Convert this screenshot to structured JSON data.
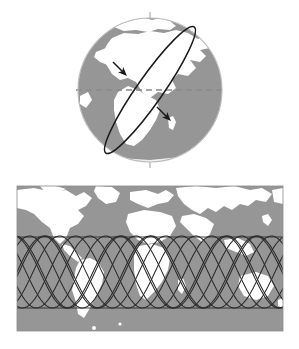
{
  "figure": {
    "caption": "",
    "width": 299,
    "height": 349,
    "background_color": "#ffffff"
  },
  "colors": {
    "ocean_gray": "#969696",
    "land_white": "#ffffff",
    "globe_outline": "#b4b4b4",
    "polar_axis": "#c0c0c0",
    "equator_dash": "#909090",
    "orbit_line": "#1a1a1a",
    "ground_track": "#2a2a2a",
    "map_border": "#8c8c8c"
  },
  "globe_panel": {
    "name": "globe-with-orbit",
    "center_x": 150,
    "center_y": 90,
    "radius": 72,
    "polar_axis": {
      "label": "polar-axis",
      "top_y": 12,
      "bottom_y": 168,
      "x": 150
    },
    "equator": {
      "label": "equator",
      "y": 90,
      "x_start": 78,
      "x_end": 222,
      "style": "dashed"
    },
    "orbit": {
      "label": "inclined-orbit-ellipse",
      "inclination_deg": 55,
      "semi_major": 76,
      "semi_minor": 13,
      "rotation_deg": -55,
      "arrow_count": 2,
      "direction": "prograde"
    }
  },
  "map_panel": {
    "name": "world-map-ground-tracks",
    "projection": "equirectangular",
    "x": 17,
    "y": 186,
    "width": 266,
    "height": 145,
    "ground_tracks": {
      "label": "sinusoidal-ground-tracks",
      "count": 9,
      "amplitude_px": 36,
      "period_px": 106,
      "center_y_px": 272,
      "inclination_deg": 55,
      "phase_shift_px": 30
    },
    "latitude_limits": {
      "north_peak_y": 237,
      "south_peak_y": 308
    }
  },
  "chart_data": {
    "type": "line",
    "xlabel": "Longitude (deg)",
    "ylabel": "Latitude (deg)",
    "xlim": [
      -180,
      180
    ],
    "ylim": [
      -90,
      90
    ],
    "grid": false,
    "legend": "none",
    "series": [
      {
        "name": "orbit-1",
        "phase_deg": 0,
        "amplitude_deg": 55
      },
      {
        "name": "orbit-2",
        "phase_deg": -25,
        "amplitude_deg": 55
      },
      {
        "name": "orbit-3",
        "phase_deg": -50,
        "amplitude_deg": 55
      },
      {
        "name": "orbit-4",
        "phase_deg": -75,
        "amplitude_deg": 55
      },
      {
        "name": "orbit-5",
        "phase_deg": -100,
        "amplitude_deg": 55
      },
      {
        "name": "orbit-6",
        "phase_deg": -125,
        "amplitude_deg": 55
      },
      {
        "name": "orbit-7",
        "phase_deg": -150,
        "amplitude_deg": 55
      },
      {
        "name": "orbit-8",
        "phase_deg": -175,
        "amplitude_deg": 55
      },
      {
        "name": "orbit-9",
        "phase_deg": -200,
        "amplitude_deg": 55
      }
    ]
  }
}
